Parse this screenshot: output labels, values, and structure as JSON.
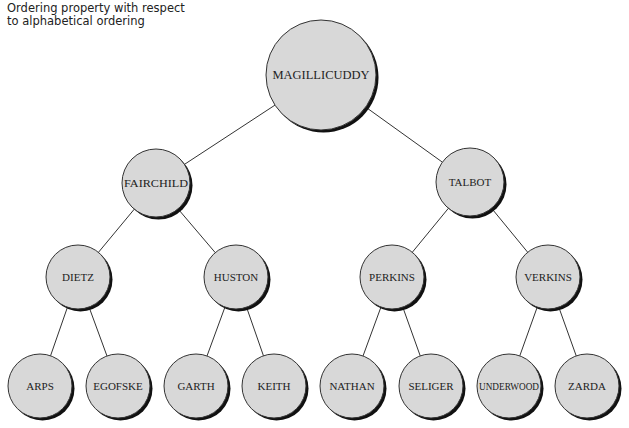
{
  "caption": {
    "line1": "Ordering property with respect",
    "line2": "to alphabetical ordering"
  },
  "colors": {
    "node_fill": "#d8d8d8",
    "node_stroke": "#333333",
    "shadow": "#111111",
    "edge": "#333333"
  },
  "tree": {
    "nodes": [
      {
        "id": "n0",
        "label": "MAGILLICUDDY",
        "cx": 321,
        "cy": 75,
        "r": 55,
        "parent": null
      },
      {
        "id": "n1",
        "label": "FAIRCHILD",
        "cx": 156,
        "cy": 183,
        "r": 34,
        "parent": "n0"
      },
      {
        "id": "n2",
        "label": "TALBOT",
        "cx": 470,
        "cy": 182,
        "r": 34,
        "parent": "n0"
      },
      {
        "id": "n3",
        "label": "DIETZ",
        "cx": 78,
        "cy": 277,
        "r": 32,
        "parent": "n1"
      },
      {
        "id": "n4",
        "label": "HUSTON",
        "cx": 236,
        "cy": 277,
        "r": 32,
        "parent": "n1"
      },
      {
        "id": "n5",
        "label": "PERKINS",
        "cx": 392,
        "cy": 277,
        "r": 32,
        "parent": "n2"
      },
      {
        "id": "n6",
        "label": "VERKINS",
        "cx": 548,
        "cy": 277,
        "r": 32,
        "parent": "n2"
      },
      {
        "id": "n7",
        "label": "ARPS",
        "cx": 40,
        "cy": 386,
        "r": 32,
        "parent": "n3"
      },
      {
        "id": "n8",
        "label": "EGOFSKE",
        "cx": 118,
        "cy": 386,
        "r": 32,
        "parent": "n3"
      },
      {
        "id": "n9",
        "label": "GARTH",
        "cx": 196,
        "cy": 386,
        "r": 32,
        "parent": "n4"
      },
      {
        "id": "n10",
        "label": "KEITH",
        "cx": 274,
        "cy": 386,
        "r": 32,
        "parent": "n4"
      },
      {
        "id": "n11",
        "label": "NATHAN",
        "cx": 352,
        "cy": 386,
        "r": 32,
        "parent": "n5"
      },
      {
        "id": "n12",
        "label": "SELIGER",
        "cx": 431,
        "cy": 386,
        "r": 32,
        "parent": "n5"
      },
      {
        "id": "n13",
        "label": "UNDERWOOD",
        "cx": 509,
        "cy": 386,
        "r": 32,
        "parent": "n6"
      },
      {
        "id": "n14",
        "label": "ZARDA",
        "cx": 587,
        "cy": 386,
        "r": 32,
        "parent": "n6"
      }
    ]
  }
}
